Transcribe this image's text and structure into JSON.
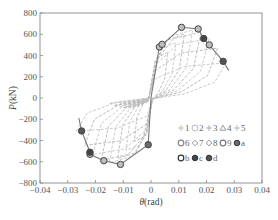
{
  "chart_data": {
    "type": "line",
    "title": "",
    "xlabel": "θ(rad)",
    "ylabel": "P(kN)",
    "xlim": [
      -0.04,
      0.04
    ],
    "ylim": [
      -800,
      800
    ],
    "xticks": [
      -0.04,
      -0.03,
      -0.02,
      -0.01,
      0,
      0.01,
      0.02,
      0.03,
      0.04
    ],
    "xtick_labels": [
      "−0.04",
      "−0.03",
      "−0.02",
      "−0.01",
      "0",
      "0.01",
      "0.02",
      "0.03",
      "0.04"
    ],
    "yticks": [
      800,
      600,
      400,
      200,
      0,
      -200,
      -400,
      -600,
      -800
    ],
    "ytick_labels": [
      "800",
      "600",
      "400",
      "200",
      "0",
      "−200",
      "−400",
      "−600",
      "−800"
    ],
    "grid": false,
    "legend_position": "lower right (inside)",
    "legend": [
      {
        "label": "1",
        "marker": "plus",
        "color": "#b8b8b8"
      },
      {
        "label": "2",
        "marker": "circle-open",
        "color": "#c8c8c8"
      },
      {
        "label": "3",
        "marker": "plus",
        "color": "#a8a8a8"
      },
      {
        "label": "4",
        "marker": "triangle-open",
        "color": "#999999"
      },
      {
        "label": "5",
        "marker": "plus",
        "color": "#b0b0b0"
      },
      {
        "label": "6",
        "marker": "circle-open",
        "color": "#888888"
      },
      {
        "label": "7",
        "marker": "diamond-open",
        "color": "#999999"
      },
      {
        "label": "8",
        "marker": "diamond-open",
        "color": "#8c8c8c"
      },
      {
        "label": "9",
        "marker": "circle-open",
        "color": "#777777"
      },
      {
        "label": "a",
        "marker": "circle-filled",
        "color": "#6a6a6a"
      },
      {
        "label": "b",
        "marker": "circle-open",
        "color": "#333333"
      },
      {
        "label": "c",
        "marker": "circle-filled",
        "color": "#444444"
      },
      {
        "label": "d",
        "marker": "circle-filled",
        "color": "#555555"
      }
    ],
    "series": [
      {
        "name": "skeleton-positive",
        "x": [
          0.0,
          0.003,
          0.004,
          0.011,
          0.017,
          0.019,
          0.021,
          0.026,
          0.028
        ],
        "y": [
          0,
          480,
          500,
          665,
          650,
          560,
          500,
          345,
          260
        ]
      },
      {
        "name": "skeleton-negative",
        "x": [
          0.0,
          -0.001,
          -0.011,
          -0.017,
          -0.022,
          -0.022,
          -0.025,
          -0.026
        ],
        "y": [
          0,
          -440,
          -625,
          -590,
          -530,
          -510,
          -310,
          -190
        ]
      },
      {
        "name": "peak-markers",
        "points": [
          {
            "x": 0.003,
            "y": 480,
            "legend": "6"
          },
          {
            "x": 0.004,
            "y": 505,
            "legend": "4"
          },
          {
            "x": 0.011,
            "y": 665,
            "legend": "b"
          },
          {
            "x": 0.017,
            "y": 650,
            "legend": "7"
          },
          {
            "x": 0.019,
            "y": 560,
            "legend": "c"
          },
          {
            "x": 0.021,
            "y": 500,
            "legend": "8"
          },
          {
            "x": 0.026,
            "y": 345,
            "legend": "d"
          },
          {
            "x": -0.001,
            "y": -440,
            "legend": "a"
          },
          {
            "x": -0.011,
            "y": -625,
            "legend": "b"
          },
          {
            "x": -0.017,
            "y": -590,
            "legend": "9"
          },
          {
            "x": -0.022,
            "y": -530,
            "legend": "8"
          },
          {
            "x": -0.022,
            "y": -510,
            "legend": "c"
          },
          {
            "x": -0.025,
            "y": -310,
            "legend": "d"
          }
        ]
      },
      {
        "name": "hysteresis-loops (dashed, light grey)",
        "description": "Multiple pinched hysteresis loops between approx θ=-0.027..0.027 rad, P=-600..650 kN"
      }
    ]
  }
}
